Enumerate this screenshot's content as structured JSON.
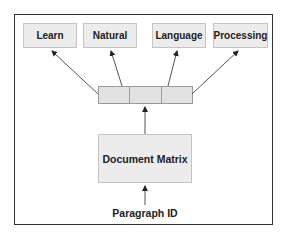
{
  "diagram": {
    "output_words": [
      {
        "label": "Learn"
      },
      {
        "label": "Natural"
      },
      {
        "label": "Language"
      },
      {
        "label": "Processing"
      }
    ],
    "vector_cells": 3,
    "matrix_label": "Document Matrix",
    "input_label": "Paragraph ID",
    "colors": {
      "box_fill": "#ececec",
      "box_border": "#c4c4c4",
      "cell_fill": "#e2e2e2",
      "frame_border": "#333333",
      "arrow": "#444444"
    }
  }
}
